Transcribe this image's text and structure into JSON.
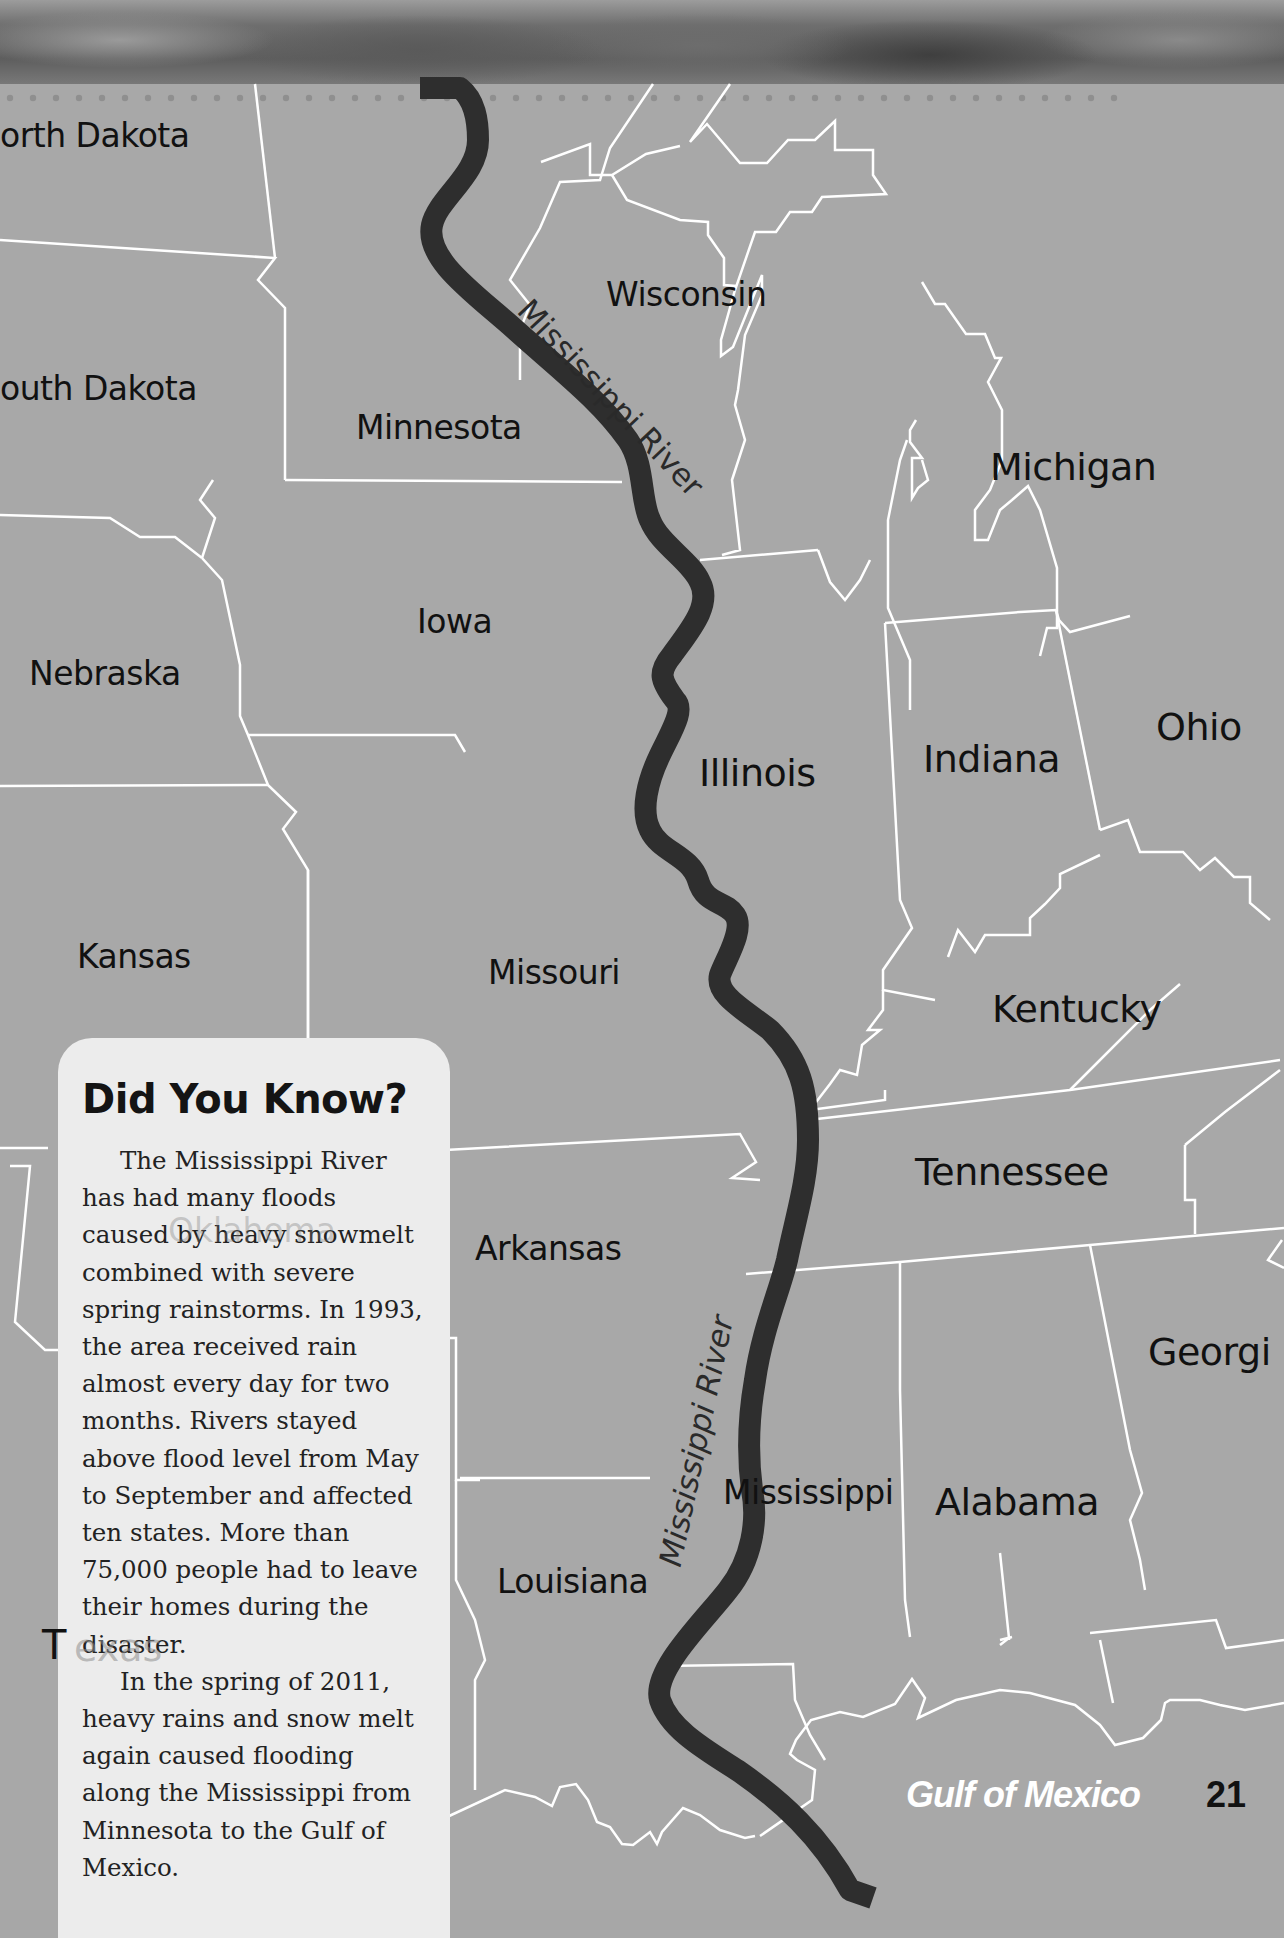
{
  "page": {
    "page_number": "21",
    "colors": {
      "land": "#a8a8a8",
      "border": "#ffffff",
      "river": "#2e2e2e",
      "sidebar_bg": "#ececec",
      "text": "#111111"
    }
  },
  "map": {
    "states": [
      {
        "name": "orth Dakota",
        "full_name": "North Dakota"
      },
      {
        "name": "outh Dakota",
        "full_name": "South Dakota"
      },
      {
        "name": "Minnesota"
      },
      {
        "name": "Wisconsin"
      },
      {
        "name": "Michigan"
      },
      {
        "name": "Iowa"
      },
      {
        "name": "Nebraska"
      },
      {
        "name": "Illinois"
      },
      {
        "name": "Indiana"
      },
      {
        "name": "Ohio"
      },
      {
        "name": "Kansas"
      },
      {
        "name": "Missouri"
      },
      {
        "name": "Kentucky"
      },
      {
        "name": "Tennessee"
      },
      {
        "name": "Arkansas"
      },
      {
        "name": "Georgi",
        "full_name": "Georgia"
      },
      {
        "name": "Mississippi"
      },
      {
        "name": "Alabama"
      },
      {
        "name": "Louisiana"
      },
      {
        "name": "Oklahoma"
      },
      {
        "name": "T",
        "full_name": "Texas"
      },
      {
        "name": "exas"
      }
    ],
    "river_labels": [
      "Mississippi River",
      "Mississippi River"
    ],
    "water_label": "Gulf of Mexico"
  },
  "sidebar": {
    "title": "Did You Know?",
    "paragraphs": [
      "The Mississippi River has had many floods caused by heavy snowmelt combined with severe spring rainstorms. In 1993, the area received rain almost every day for two months. Rivers stayed above flood level from May to September and affected ten states. More than 75,000 people had to leave their homes during the disaster.",
      "In the spring of 2011, heavy rains and snow melt again caused flooding along the Mississippi from Minnesota to the Gulf of Mexico."
    ]
  }
}
